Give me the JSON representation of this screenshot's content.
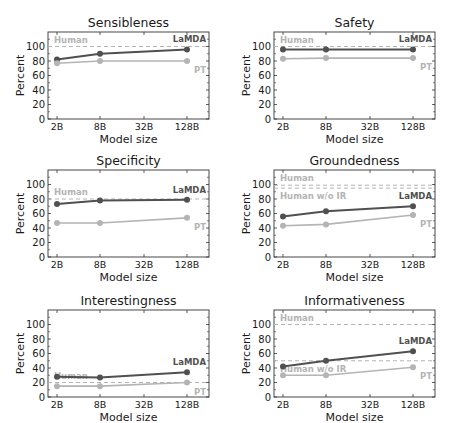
{
  "chart_data": [
    {
      "type": "line",
      "title": "Sensibleness",
      "xlabel": "Model size",
      "ylabel": "Percent",
      "x": [
        "2B",
        "8B",
        "32B",
        "128B"
      ],
      "ylim": [
        0,
        120
      ],
      "yticks": [
        0,
        20,
        40,
        60,
        80,
        100
      ],
      "series": [
        {
          "name": "LaMDA",
          "x": [
            "2B",
            "8B",
            "128B"
          ],
          "values": [
            82,
            90,
            96
          ],
          "color": "#505050"
        },
        {
          "name": "PT",
          "x": [
            "2B",
            "8B",
            "128B"
          ],
          "values": [
            77,
            80,
            80
          ],
          "color": "#b4b4b4"
        }
      ],
      "reference_lines": [
        {
          "name": "Human",
          "value": 100,
          "color": "#b4b4b4"
        }
      ]
    },
    {
      "type": "line",
      "title": "Safety",
      "xlabel": "Model size",
      "ylabel": "Percent",
      "x": [
        "2B",
        "8B",
        "32B",
        "128B"
      ],
      "ylim": [
        0,
        120
      ],
      "yticks": [
        0,
        20,
        40,
        60,
        80,
        100
      ],
      "series": [
        {
          "name": "LaMDA",
          "x": [
            "2B",
            "8B",
            "128B"
          ],
          "values": [
            96,
            96,
            96
          ],
          "color": "#505050"
        },
        {
          "name": "PT",
          "x": [
            "2B",
            "8B",
            "128B"
          ],
          "values": [
            83,
            84,
            84
          ],
          "color": "#b4b4b4"
        }
      ],
      "reference_lines": [
        {
          "name": "Human",
          "value": 100,
          "color": "#b4b4b4"
        }
      ]
    },
    {
      "type": "line",
      "title": "Specificity",
      "xlabel": "Model size",
      "ylabel": "Percent",
      "x": [
        "2B",
        "8B",
        "32B",
        "128B"
      ],
      "ylim": [
        0,
        120
      ],
      "yticks": [
        0,
        20,
        40,
        60,
        80,
        100
      ],
      "series": [
        {
          "name": "LaMDA",
          "x": [
            "2B",
            "8B",
            "128B"
          ],
          "values": [
            73,
            78,
            79
          ],
          "color": "#505050"
        },
        {
          "name": "PT",
          "x": [
            "2B",
            "8B",
            "128B"
          ],
          "values": [
            47,
            47,
            54
          ],
          "color": "#b4b4b4"
        }
      ],
      "reference_lines": [
        {
          "name": "Human",
          "value": 80,
          "color": "#b4b4b4"
        }
      ]
    },
    {
      "type": "line",
      "title": "Groundedness",
      "xlabel": "Model size",
      "ylabel": "Percent",
      "x": [
        "2B",
        "8B",
        "32B",
        "128B"
      ],
      "ylim": [
        0,
        120
      ],
      "yticks": [
        0,
        20,
        40,
        60,
        80,
        100
      ],
      "series": [
        {
          "name": "LaMDA",
          "x": [
            "2B",
            "8B",
            "128B"
          ],
          "values": [
            56,
            63,
            70
          ],
          "color": "#505050"
        },
        {
          "name": "PT",
          "x": [
            "2B",
            "8B",
            "128B"
          ],
          "values": [
            43,
            45,
            58
          ],
          "color": "#b4b4b4"
        }
      ],
      "reference_lines": [
        {
          "name": "Human",
          "value": 99,
          "color": "#b4b4b4"
        },
        {
          "name": "Human w/o IR",
          "value": 95,
          "color": "#b4b4b4"
        }
      ]
    },
    {
      "type": "line",
      "title": "Interestingness",
      "xlabel": "Model size",
      "ylabel": "Percent",
      "x": [
        "2B",
        "8B",
        "32B",
        "128B"
      ],
      "ylim": [
        0,
        120
      ],
      "yticks": [
        0,
        20,
        40,
        60,
        80,
        100
      ],
      "series": [
        {
          "name": "LaMDA",
          "x": [
            "2B",
            "8B",
            "128B"
          ],
          "values": [
            28,
            27,
            34
          ],
          "color": "#505050"
        },
        {
          "name": "PT",
          "x": [
            "2B",
            "8B",
            "128B"
          ],
          "values": [
            15,
            15,
            20
          ],
          "color": "#b4b4b4"
        }
      ],
      "reference_lines": [
        {
          "name": "Human",
          "value": 20,
          "color": "#b4b4b4"
        }
      ]
    },
    {
      "type": "line",
      "title": "Informativeness",
      "xlabel": "Model size",
      "ylabel": "Percent",
      "x": [
        "2B",
        "8B",
        "32B",
        "128B"
      ],
      "ylim": [
        0,
        120
      ],
      "yticks": [
        0,
        20,
        40,
        60,
        80,
        100
      ],
      "series": [
        {
          "name": "LaMDA",
          "x": [
            "2B",
            "8B",
            "128B"
          ],
          "values": [
            42,
            50,
            63
          ],
          "color": "#505050"
        },
        {
          "name": "PT",
          "x": [
            "2B",
            "8B",
            "128B"
          ],
          "values": [
            30,
            30,
            41
          ],
          "color": "#b4b4b4"
        }
      ],
      "reference_lines": [
        {
          "name": "Human",
          "value": 100,
          "color": "#b4b4b4"
        },
        {
          "name": "Human w/o IR",
          "value": 50,
          "color": "#b4b4b4"
        }
      ]
    }
  ]
}
